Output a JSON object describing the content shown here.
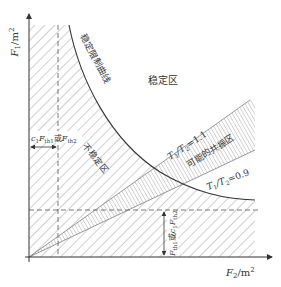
{
  "diagram": {
    "axes": {
      "y_label": "F",
      "y_label_sub": "1",
      "y_label_unit": "/m",
      "y_label_sup": "2",
      "x_label": "F",
      "x_label_sub": "2",
      "x_label_unit": "/m",
      "x_label_sup": "2"
    },
    "regions": {
      "stable": "稳定区",
      "unstable": "不稳定区",
      "resonance": "可能的共振区"
    },
    "curves": {
      "stability_limit": "稳定限制曲线",
      "ratio_upper": "T",
      "ratio_upper_rest": "=1.1",
      "ratio_lower": "T",
      "ratio_lower_rest": "=0.9",
      "ratio_sub1": "1",
      "ratio_sub2": "2",
      "ratio_slash": "/T"
    },
    "dimensions": {
      "horizontal": {
        "c": "c",
        "c_sub": "1",
        "F1": "F",
        "F1_sub": "th1",
        "or": "或",
        "F2": "F",
        "F2_sub": "th2"
      },
      "vertical": {
        "F1": "F",
        "F1_sub": "th1",
        "or": "或",
        "c": "c",
        "c_sub": "1",
        "F2": "F",
        "F2_sub": "th2"
      }
    },
    "colors": {
      "line": "#333333",
      "hatch": "#8a8a8a",
      "background": "#ffffff"
    }
  }
}
